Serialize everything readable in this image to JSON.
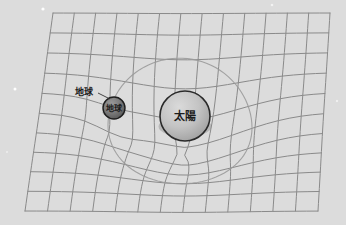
{
  "figure": {
    "kind": "spacetime-curvature-diagram",
    "width": 346,
    "height": 225,
    "background_color": "#dcdcdc",
    "description_title": ""
  },
  "grid": {
    "line_color": "#8a8a8a",
    "line_width": 1.0,
    "columns": 13,
    "rows": 10,
    "corners": {
      "top_left": [
        53,
        13
      ],
      "top_right": [
        330,
        13
      ],
      "bottom_right": [
        318,
        211
      ],
      "bottom_left": [
        25,
        211
      ]
    }
  },
  "well": {
    "center": [
      185,
      118
    ],
    "depth": 46,
    "radius": 118,
    "secondary_center": [
      114,
      108
    ],
    "secondary_depth": 11,
    "secondary_radius": 42
  },
  "orbit": {
    "name": "earth-orbit-ellipse",
    "center": [
      180,
      115
    ],
    "rx": 72,
    "ry": 62,
    "stroke": "#9a9a9a",
    "stroke_width": 1.1
  },
  "bodies": [
    {
      "id": "sun",
      "label": "太陽",
      "label_font_size": 11,
      "center": [
        185,
        116
      ],
      "radius": 25,
      "fill_light": "#cfcfcf",
      "fill_dark": "#9f9f9f",
      "stroke": "#2a2a2a",
      "stroke_width": 1.6
    },
    {
      "id": "earth",
      "label": "地球",
      "label_font_size": 8,
      "center": [
        114,
        108
      ],
      "radius": 11,
      "fill_light": "#8f8f8f",
      "fill_dark": "#5c5c5c",
      "stroke": "#1e1e1e",
      "stroke_width": 1.4
    }
  ],
  "callouts": [
    {
      "id": "earth-callout",
      "text": "地球",
      "font_size": 9,
      "text_position": [
        84,
        92
      ],
      "leader_from": [
        98,
        93
      ],
      "leader_to": [
        110,
        99
      ]
    }
  ],
  "stars": [
    {
      "x": 43,
      "y": 9,
      "r": 1.6,
      "color": "#ffffff"
    },
    {
      "x": 272,
      "y": 5,
      "r": 1.3,
      "color": "#f2f2f2"
    },
    {
      "x": 15,
      "y": 89,
      "r": 1.5,
      "color": "#ffffff"
    },
    {
      "x": 337,
      "y": 101,
      "r": 1.2,
      "color": "#f0f0f0"
    },
    {
      "x": 7,
      "y": 152,
      "r": 1.1,
      "color": "#ededed"
    }
  ]
}
